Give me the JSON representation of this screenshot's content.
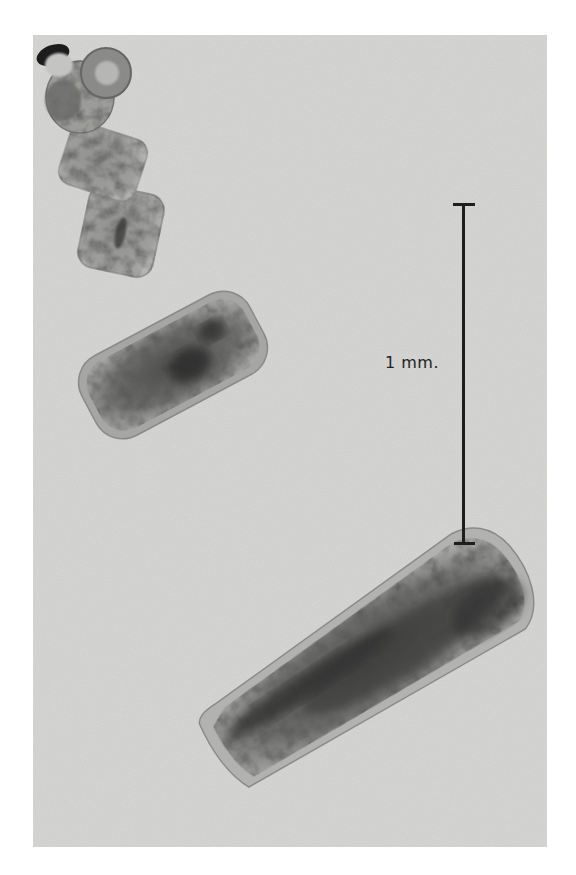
{
  "figure": {
    "background_color": "#d6d6d4",
    "specimen_color_dark": "#2a2a2a",
    "specimen_color_light": "#9a9a98",
    "segments": [
      "scolex",
      "neck segment",
      "immature proglottid",
      "mature proglottid",
      "gravid proglottid"
    ],
    "scale_bar": {
      "label": "1 mm.",
      "color": "#1e1e1e",
      "orientation": "vertical"
    }
  }
}
